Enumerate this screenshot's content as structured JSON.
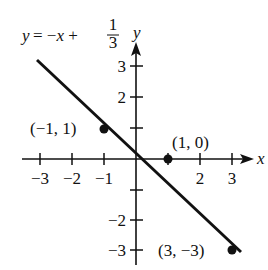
{
  "chart_data": {
    "type": "line",
    "equation": {
      "lhs": "y",
      "rhs": "= −x + ",
      "frac_num": "1",
      "frac_den": "3"
    },
    "xlabel": "x",
    "ylabel": "y",
    "xlim": [
      -3.3,
      3.4
    ],
    "ylim": [
      -3.3,
      3.6
    ],
    "x_ticks": [
      -3,
      -2,
      -1,
      1,
      2,
      3
    ],
    "x_tick_labels": [
      "−3",
      "−2",
      "−1",
      "",
      "2",
      "3"
    ],
    "y_ticks": [
      3,
      2,
      1,
      -1,
      -2,
      -3
    ],
    "y_tick_labels": [
      "3",
      "2",
      "",
      "",
      "−2",
      "−3"
    ],
    "grid": false,
    "series": [
      {
        "name": "y = -x + 1/3",
        "type": "line",
        "x": [
          -3.0,
          3.0
        ],
        "y": [
          3.333,
          -2.667
        ]
      }
    ],
    "points": [
      {
        "x": -1,
        "y": 1,
        "label": "(−1, 1)"
      },
      {
        "x": 1,
        "y": 0,
        "label": "(1, 0)"
      },
      {
        "x": 3,
        "y": -3,
        "label": "(3, −3)"
      }
    ]
  }
}
